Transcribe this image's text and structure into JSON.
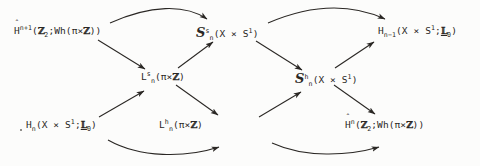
{
  "diagram": {
    "kind": "commutative-braid-diagram",
    "width": 480,
    "height": 166,
    "background_color": "#fcfcfb",
    "ink_color": "#2a2724",
    "nodes": [
      {
        "id": "top-left",
        "position": "top-left",
        "plain": "Ĥ^{n+1}(Z_2;Wh(pi x Z))",
        "base": "H",
        "accent": "^",
        "superscript": "n+1",
        "args_prefix": "(",
        "arg1": "Z",
        "arg1_sub": "2",
        "sep": ";Wh(",
        "arg2": "π × Z",
        "args_suffix": "))"
      },
      {
        "id": "top-middle",
        "position": "top-middle",
        "plain": "S^s_n(X x S^1)",
        "base": "S",
        "superscript": "s",
        "subscript": "n",
        "args": "(X × S",
        "arg_sup": "1",
        "args_suffix": ")"
      },
      {
        "id": "top-right",
        "position": "top-right",
        "plain": "H_{n-1}(X x S^1;L_0)",
        "base": "H",
        "subscript": "n-1",
        "args": "(X × S",
        "arg_sup": "1",
        "sep": ";",
        "arg2": "L",
        "arg2_sub": "0",
        "args_suffix": ")"
      },
      {
        "id": "middle-left",
        "position": "middle-left",
        "plain": "L^s_n(pi x Z)",
        "base": "L",
        "superscript": "s",
        "subscript": "n",
        "args": "(π × Z)"
      },
      {
        "id": "middle-right",
        "position": "middle-right",
        "plain": "S^h_n(X x S^1)",
        "base": "S",
        "superscript": "h",
        "subscript": "n",
        "args": "(X × S",
        "arg_sup": "1",
        "args_suffix": ")"
      },
      {
        "id": "bottom-left",
        "position": "bottom-left",
        "plain": "H_n(X x S^1;L_0)",
        "base": "H",
        "subscript": "n",
        "args": "(X × S",
        "arg_sup": "1",
        "sep": ";",
        "arg2": "L",
        "arg2_sub": "0",
        "args_suffix": ")"
      },
      {
        "id": "bottom-middle",
        "position": "bottom-middle",
        "plain": "L^h_n(pi x Z)",
        "base": "L",
        "superscript": "h",
        "subscript": "n",
        "args": "(π × Z)"
      },
      {
        "id": "bottom-right",
        "position": "bottom-right",
        "plain": "Ĥ^{n}(Z_2;Wh(pi x Z))",
        "base": "H",
        "accent": "^",
        "superscript": "n",
        "args_prefix": "(",
        "arg1": "Z",
        "arg1_sub": "2",
        "sep": ";Wh(",
        "arg2": "π × Z",
        "args_suffix": "))"
      }
    ],
    "arrows": [
      {
        "id": "arc-tl-to-tm",
        "from": "top-left",
        "to": "top-middle",
        "style": "curved-over"
      },
      {
        "id": "arc-bl-to-bm",
        "from": "bottom-left",
        "to": "bottom-middle",
        "style": "curved-under"
      },
      {
        "id": "arc-tm-to-tr",
        "from": "top-middle",
        "to": "top-right",
        "style": "curved-over"
      },
      {
        "id": "arc-bm-to-br",
        "from": "bottom-middle",
        "to": "bottom-right",
        "style": "curved-under"
      },
      {
        "id": "tl-to-ml",
        "from": "top-left",
        "to": "middle-left",
        "style": "straight"
      },
      {
        "id": "ml-to-tm",
        "from": "middle-left",
        "to": "top-middle",
        "style": "straight"
      },
      {
        "id": "bl-to-ml",
        "from": "bottom-left",
        "to": "middle-left",
        "style": "straight"
      },
      {
        "id": "ml-to-bm",
        "from": "middle-left",
        "to": "bottom-middle",
        "style": "straight"
      },
      {
        "id": "tm-to-mr",
        "from": "top-middle",
        "to": "middle-right",
        "style": "straight"
      },
      {
        "id": "mr-to-tr",
        "from": "middle-right",
        "to": "top-right",
        "style": "straight"
      },
      {
        "id": "bm-to-mr",
        "from": "bottom-middle",
        "to": "middle-right",
        "style": "straight"
      },
      {
        "id": "mr-to-br",
        "from": "middle-right",
        "to": "bottom-right",
        "style": "straight"
      }
    ],
    "marks": {
      "hat": "ˆ",
      "times": "×",
      "pi": "π",
      "integers": "Z",
      "l_theory": "L"
    }
  }
}
